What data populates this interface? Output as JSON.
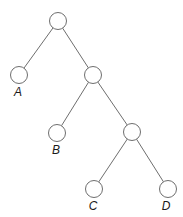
{
  "diagram": {
    "type": "binary-tree",
    "node_radius": 8.5,
    "colors": {
      "stroke": "#6e6e6e",
      "fill": "#ffffff",
      "label": "#1a1a1a"
    },
    "nodes": [
      {
        "id": "root",
        "x": 58,
        "y": 21,
        "label": ""
      },
      {
        "id": "A",
        "x": 19,
        "y": 75,
        "label": "A",
        "label_x": 18,
        "label_y": 96
      },
      {
        "id": "n2",
        "x": 93,
        "y": 75,
        "label": ""
      },
      {
        "id": "B",
        "x": 57,
        "y": 133,
        "label": "B",
        "label_x": 56,
        "label_y": 154
      },
      {
        "id": "n3",
        "x": 132,
        "y": 132,
        "label": ""
      },
      {
        "id": "C",
        "x": 94,
        "y": 189,
        "label": "C",
        "label_x": 93,
        "label_y": 210
      },
      {
        "id": "D",
        "x": 168,
        "y": 189,
        "label": "D",
        "label_x": 166,
        "label_y": 210
      }
    ],
    "edges": [
      {
        "from": "root",
        "to": "A"
      },
      {
        "from": "root",
        "to": "n2"
      },
      {
        "from": "n2",
        "to": "B"
      },
      {
        "from": "n2",
        "to": "n3"
      },
      {
        "from": "n3",
        "to": "C"
      },
      {
        "from": "n3",
        "to": "D"
      }
    ],
    "leaf_labels": [
      "A",
      "B",
      "C",
      "D"
    ]
  }
}
